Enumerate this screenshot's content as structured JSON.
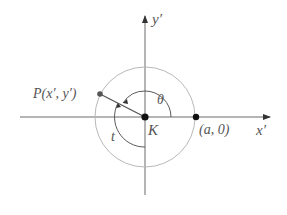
{
  "diagram": {
    "type": "coordinate-rotation",
    "axes": {
      "x_label": "x′",
      "y_label": "y′"
    },
    "origin_label": "K",
    "point_P_label": "P(x′, y′)",
    "point_a_label": "(a, 0)",
    "angle_theta_label": "θ",
    "angle_t_label": "t",
    "colors": {
      "axis": "#6a6a6a",
      "circle": "#b8b8b8",
      "arc": "#5a5a5a",
      "point": "#111111",
      "text": "#555555"
    }
  }
}
